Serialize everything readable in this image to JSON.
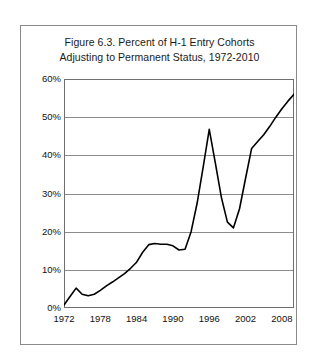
{
  "figure": {
    "title_line_1": "Figure 6.3.  Percent of H-1 Entry Cohorts",
    "title_line_2": "Adjusting to Permanent Status, 1972-2010"
  },
  "chart_data": {
    "type": "line",
    "title": "Figure 6.3.  Percent of H-1 Entry Cohorts Adjusting to Permanent Status, 1972-2010",
    "xlabel": "",
    "ylabel": "",
    "xlim": [
      1972,
      2010
    ],
    "ylim": [
      0,
      60
    ],
    "grid": true,
    "legend": "none",
    "line_color": "#000000",
    "y_tick_labels": [
      "0%",
      "10%",
      "20%",
      "30%",
      "40%",
      "50%",
      "60%"
    ],
    "y_tick_values": [
      0,
      10,
      20,
      30,
      40,
      50,
      60
    ],
    "x_tick_labels": [
      "1972",
      "1978",
      "1984",
      "1990",
      "1996",
      "2002",
      "2008"
    ],
    "x_tick_values": [
      1972,
      1978,
      1984,
      1990,
      1996,
      2002,
      2008
    ],
    "x_minor_tick_interval": 1,
    "x": [
      1972,
      1973,
      1974,
      1975,
      1976,
      1977,
      1978,
      1979,
      1980,
      1981,
      1982,
      1983,
      1984,
      1985,
      1986,
      1987,
      1988,
      1989,
      1990,
      1991,
      1992,
      1993,
      1994,
      1995,
      1996,
      1997,
      1998,
      1999,
      2000,
      2001,
      2002,
      2003,
      2004,
      2005,
      2006,
      2007,
      2008,
      2009,
      2010
    ],
    "values": [
      0.8,
      3.0,
      5.2,
      3.6,
      3.2,
      3.6,
      4.6,
      5.8,
      6.8,
      7.9,
      9.0,
      10.4,
      12.0,
      14.6,
      16.6,
      16.9,
      16.7,
      16.7,
      16.3,
      15.2,
      15.4,
      20.0,
      27.5,
      37.0,
      46.8,
      38.0,
      29.0,
      22.5,
      21.0,
      26.0,
      34.0,
      41.8,
      43.6,
      45.4,
      47.6,
      50.0,
      52.2,
      54.2,
      56.0
    ],
    "series_name": "Percent adjusting to permanent status"
  }
}
